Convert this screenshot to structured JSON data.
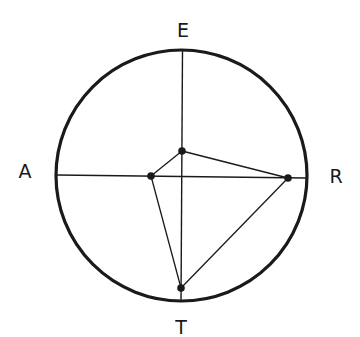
{
  "diagram": {
    "type": "circular-axis-plot",
    "axes": [
      {
        "label": "E",
        "position": "top"
      },
      {
        "label": "R",
        "position": "right"
      },
      {
        "label": "T",
        "position": "bottom"
      },
      {
        "label": "A",
        "position": "left"
      }
    ],
    "nodes": [
      {
        "id": "E",
        "x": 182,
        "y": 151
      },
      {
        "id": "A",
        "x": 151,
        "y": 176
      },
      {
        "id": "R",
        "x": 288,
        "y": 178
      },
      {
        "id": "T",
        "x": 181,
        "y": 288
      }
    ],
    "edges": [
      [
        "A",
        "E"
      ],
      [
        "E",
        "R"
      ],
      [
        "R",
        "T"
      ],
      [
        "T",
        "A"
      ]
    ],
    "colors": {
      "stroke": "#1a1a1a",
      "background": "#ffffff"
    }
  }
}
